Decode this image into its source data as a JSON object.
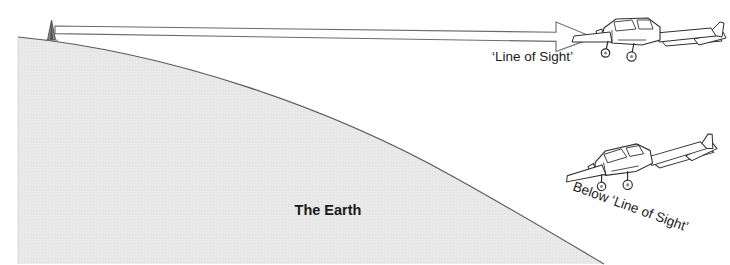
{
  "figure": {
    "type": "schematic-diagram",
    "background_color": "#ffffff"
  },
  "labels": {
    "earth": "The Earth",
    "line_of_sight": "‘Line of Sight’",
    "below_line_of_sight": "Below ‘Line of Sight’"
  },
  "elements": {
    "earth": {
      "name": "The Earth",
      "fill_color": "#e6e6e6",
      "stroke_color": "#4d4d4d"
    },
    "antenna": {
      "name": "ground-antenna-tower",
      "fill_color": "#595959",
      "stroke_color": "#333333"
    },
    "arrow": {
      "name": "line-of-sight-arrow",
      "fill_color": "#ffffff",
      "stroke_color": "#4d4d4d",
      "direction": "left-to-right"
    },
    "aircraft_upper": {
      "name": "aircraft-within-line-of-sight",
      "stroke_color": "#333333",
      "fill_color": "#ffffff"
    },
    "aircraft_lower": {
      "name": "aircraft-below-line-of-sight",
      "stroke_color": "#333333",
      "fill_color": "#ffffff"
    }
  },
  "text_style": {
    "earth_font_size": "14",
    "earth_font_weight": "bold",
    "line_of_sight_font_size": "13",
    "below_label_font_size": "13",
    "below_label_rotation_deg": "-20"
  }
}
